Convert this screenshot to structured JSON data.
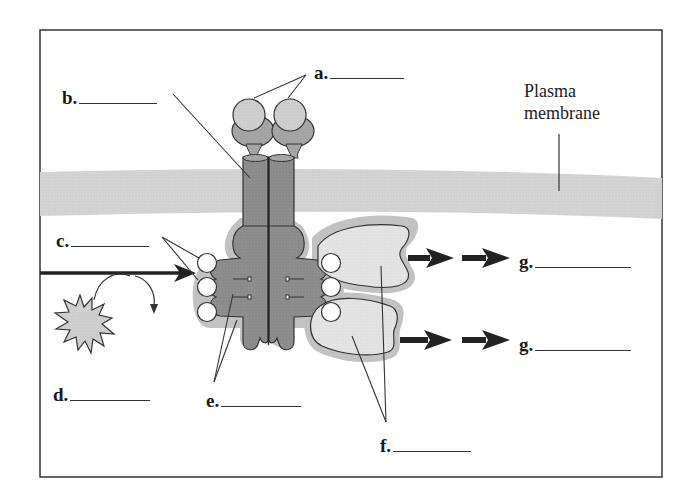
{
  "figure": {
    "type": "receptor-signaling-diagram",
    "colors": {
      "frame": "#333333",
      "membrane": "#d6d6d6",
      "receptor_dark": "#8f8f8f",
      "receptor_light": "#c9c9c9",
      "halo": "#bdbdbd",
      "relay_protein": "#e3e3e3",
      "phosphate": "#ffffff",
      "arrow": "#1f1f1f"
    }
  },
  "labels": {
    "a": {
      "letter": "a.",
      "blank": ""
    },
    "b": {
      "letter": "b.",
      "blank": ""
    },
    "c": {
      "letter": "c.",
      "blank": ""
    },
    "d": {
      "letter": "d.",
      "blank": ""
    },
    "e": {
      "letter": "e.",
      "blank": ""
    },
    "f": {
      "letter": "f.",
      "blank": ""
    },
    "g1": {
      "letter": "g.",
      "blank": ""
    },
    "g2": {
      "letter": "g.",
      "blank": ""
    }
  },
  "annotations": {
    "membrane_line1": "Plasma",
    "membrane_line2": "membrane"
  }
}
